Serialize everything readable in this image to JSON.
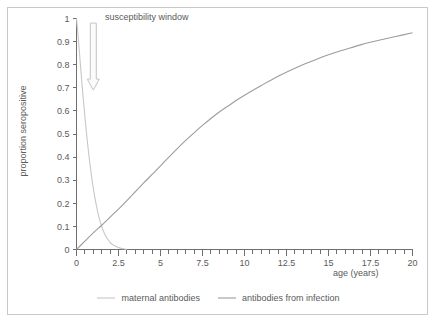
{
  "chart_data": {
    "type": "line",
    "title": "",
    "xlabel": "age (years)",
    "ylabel": "proportion seropositive",
    "xlim": [
      0,
      20
    ],
    "ylim": [
      0,
      1
    ],
    "grid": false,
    "legend_position": "bottom",
    "x_ticks": [
      "0",
      "2.5",
      "5",
      "7.5",
      "10",
      "12.5",
      "15",
      "17.5",
      "20"
    ],
    "x_tick_values": [
      0,
      2.5,
      5,
      7.5,
      10,
      12.5,
      15,
      17.5,
      20
    ],
    "x_minor_step": 0.5,
    "y_ticks": [
      "0",
      "0.1",
      "0.2",
      "0.3",
      "0.4",
      "0.5",
      "0.6",
      "0.7",
      "0.8",
      "0.9",
      "1"
    ],
    "y_tick_values": [
      0,
      0.1,
      0.2,
      0.3,
      0.4,
      0.5,
      0.6,
      0.7,
      0.8,
      0.9,
      1
    ],
    "annotations": [
      {
        "text": "susceptibility window",
        "x": 1.0,
        "y": 1.0,
        "marker": "down-arrow",
        "arrow_from_y": 0.98,
        "arrow_to_y": 0.69
      }
    ],
    "series": [
      {
        "name": "maternal antibodies",
        "color": "#c7c7c7",
        "x": [
          0,
          0.05,
          0.1,
          0.15,
          0.2,
          0.25,
          0.3,
          0.4,
          0.5,
          0.6,
          0.7,
          0.8,
          0.9,
          1.0,
          1.1,
          1.2,
          1.3,
          1.4,
          1.5,
          1.6,
          1.7,
          1.8,
          1.9,
          2.0,
          2.1,
          2.2,
          2.4,
          2.6,
          2.8,
          3.0
        ],
        "y": [
          1.0,
          0.96,
          0.92,
          0.875,
          0.83,
          0.785,
          0.74,
          0.655,
          0.575,
          0.5,
          0.432,
          0.37,
          0.315,
          0.265,
          0.222,
          0.184,
          0.151,
          0.123,
          0.1,
          0.08,
          0.064,
          0.051,
          0.04,
          0.031,
          0.024,
          0.019,
          0.011,
          0.006,
          0.003,
          0.0
        ]
      },
      {
        "name": "antibodies from infection",
        "color": "#9d9d9d",
        "x": [
          0,
          0.5,
          1,
          1.5,
          2,
          2.5,
          3,
          3.5,
          4,
          4.5,
          5,
          5.5,
          6,
          6.5,
          7,
          7.5,
          8,
          8.5,
          9,
          9.5,
          10,
          11,
          12,
          13,
          14,
          15,
          16,
          17,
          18,
          19,
          20
        ],
        "y": [
          0.0,
          0.036,
          0.072,
          0.105,
          0.14,
          0.175,
          0.212,
          0.25,
          0.288,
          0.325,
          0.362,
          0.4,
          0.437,
          0.472,
          0.505,
          0.537,
          0.567,
          0.595,
          0.62,
          0.645,
          0.668,
          0.71,
          0.75,
          0.785,
          0.815,
          0.843,
          0.866,
          0.888,
          0.906,
          0.922,
          0.938
        ]
      }
    ]
  },
  "legend": {
    "items": [
      {
        "label": "maternal antibodies",
        "color": "#c7c7c7"
      },
      {
        "label": "antibodies from infection",
        "color": "#9d9d9d"
      }
    ]
  },
  "axes": {
    "x_title": "age (years)",
    "y_title": "proportion seropositive"
  },
  "colors": {
    "axis": "#6f6f6f",
    "text": "#5a5a5a",
    "frame": "#c9c9c9",
    "background": "#ffffff",
    "maternal": "#c7c7c7",
    "infection": "#9d9d9d",
    "arrow_fill": "#fbfbfb",
    "arrow_stroke": "#c4c4c4"
  }
}
